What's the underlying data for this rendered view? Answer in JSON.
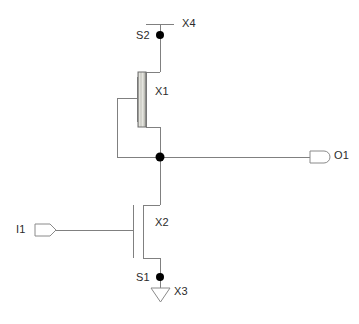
{
  "diagram": {
    "type": "circuit-schematic",
    "background_color": "#ffffff",
    "wire_color": "#808080",
    "node_color": "#000000",
    "text_color": "#2b2b2b",
    "gate_fill_color": "#d9d9d4"
  },
  "labels": {
    "x4": "X4",
    "s2": "S2",
    "x1": "X1",
    "o1": "O1",
    "i1": "I1",
    "x2": "X2",
    "s1": "S1",
    "x3": "X3"
  },
  "components": [
    {
      "id": "X1",
      "label": "X1",
      "kind": "pmos-transistor",
      "x": 137,
      "y": 72,
      "width": 9,
      "height": 55
    },
    {
      "id": "X2",
      "label": "X2",
      "kind": "nmos-transistor",
      "x": 133,
      "y": 205,
      "width": 10,
      "height": 53
    },
    {
      "id": "X4",
      "label": "X4",
      "kind": "power-rail",
      "x": 146,
      "y": 24,
      "width": 28,
      "height": 1
    },
    {
      "id": "X3",
      "label": "X3",
      "kind": "ground-symbol",
      "x": 151,
      "y": 288,
      "width": 19,
      "height": 14
    }
  ],
  "ports": [
    {
      "id": "I1",
      "label": "I1",
      "kind": "input-port",
      "x": 35,
      "y": 224,
      "width": 21,
      "height": 12
    },
    {
      "id": "O1",
      "label": "O1",
      "kind": "output-port",
      "x": 310,
      "y": 151,
      "width": 21,
      "height": 12
    }
  ],
  "nodes": [
    {
      "id": "S2",
      "label": "S2",
      "x": 160,
      "y": 35,
      "radius": 4
    },
    {
      "id": "N_OUT",
      "label": "",
      "x": 160,
      "y": 157,
      "radius": 4
    },
    {
      "id": "S1",
      "label": "S1",
      "x": 160,
      "y": 277,
      "radius": 4
    }
  ],
  "nets": [
    {
      "name": "vdd",
      "from": "X4",
      "to": "S2"
    },
    {
      "name": "pmos-source",
      "from": "S2",
      "to": "X1-source"
    },
    {
      "name": "pmos-drain-to-out",
      "from": "X1-drain",
      "to": "N_OUT"
    },
    {
      "name": "pmos-gate-feedback",
      "from": "X1-gate",
      "to": "N_OUT"
    },
    {
      "name": "out-to-port",
      "from": "N_OUT",
      "to": "O1"
    },
    {
      "name": "out-to-nmos-drain",
      "from": "N_OUT",
      "to": "X2-drain"
    },
    {
      "name": "nmos-source-to-gnd",
      "from": "X2-source",
      "to": "S1"
    },
    {
      "name": "gnd",
      "from": "S1",
      "to": "X3"
    },
    {
      "name": "input-to-nmos-gate",
      "from": "I1",
      "to": "X2-gate"
    }
  ]
}
